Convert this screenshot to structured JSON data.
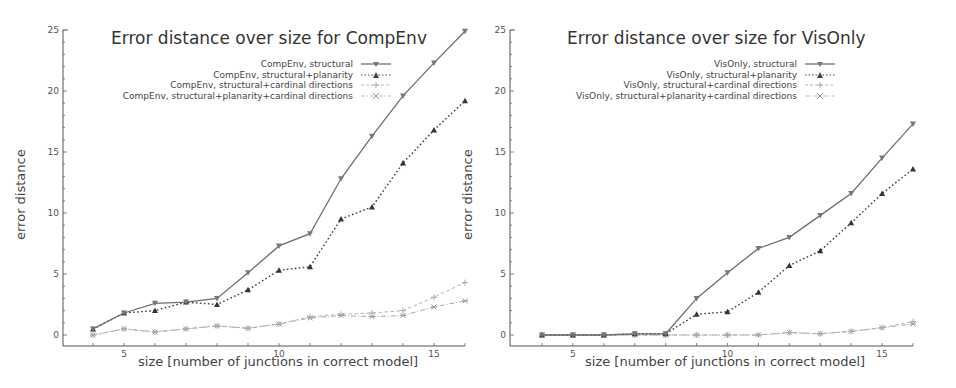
{
  "chart_data": [
    {
      "type": "line",
      "title": "Error distance over size for CompEnv",
      "xlabel": "size [number of junctions in correct model]",
      "ylabel": "error distance",
      "x": [
        4,
        5,
        6,
        7,
        8,
        9,
        10,
        11,
        12,
        13,
        14,
        15,
        16
      ],
      "xticks": [
        5,
        10,
        15
      ],
      "yticks": [
        0,
        5,
        10,
        15,
        20,
        25
      ],
      "xlim": [
        3,
        16
      ],
      "ylim": [
        -1,
        25
      ],
      "grid": false,
      "legend_position": "upper center-right",
      "series": [
        {
          "name": "CompEnv, structural",
          "style": "solid",
          "marker": "triangle-down",
          "values": [
            0.5,
            1.8,
            2.6,
            2.7,
            3.0,
            5.1,
            7.3,
            8.3,
            12.8,
            16.3,
            19.6,
            22.3,
            24.9
          ]
        },
        {
          "name": "CompEnv, structural+planarity",
          "style": "dotted",
          "marker": "triangle-up",
          "values": [
            0.5,
            1.8,
            2.0,
            2.7,
            2.5,
            3.7,
            5.3,
            5.6,
            9.5,
            10.5,
            14.1,
            16.8,
            19.2
          ]
        },
        {
          "name": "CompEnv, structural+cardinal directions",
          "style": "dashed",
          "marker": "plus",
          "values": [
            0.0,
            0.5,
            0.25,
            0.5,
            0.75,
            0.55,
            0.9,
            1.5,
            1.7,
            1.8,
            2.0,
            3.1,
            4.3
          ]
        },
        {
          "name": "CompEnv, structural+planarity+cardinal directions",
          "style": "dashdot",
          "marker": "star",
          "values": [
            0.0,
            0.5,
            0.25,
            0.5,
            0.75,
            0.55,
            0.9,
            1.4,
            1.6,
            1.5,
            1.6,
            2.3,
            2.8
          ]
        }
      ]
    },
    {
      "type": "line",
      "title": "Error distance over size for VisOnly",
      "xlabel": "size [number of junctions in correct model]",
      "ylabel": "error distance",
      "x": [
        4,
        5,
        6,
        7,
        8,
        9,
        10,
        11,
        12,
        13,
        14,
        15,
        16
      ],
      "xticks": [
        5,
        10,
        15
      ],
      "yticks": [
        0,
        5,
        10,
        15,
        20,
        25
      ],
      "xlim": [
        3,
        16
      ],
      "ylim": [
        -1,
        25
      ],
      "grid": false,
      "legend_position": "upper center-right",
      "series": [
        {
          "name": "VisOnly, structural",
          "style": "solid",
          "marker": "triangle-down",
          "values": [
            0,
            0,
            0,
            0.1,
            0.1,
            3.0,
            5.1,
            7.1,
            8.0,
            9.8,
            11.6,
            14.5,
            17.3
          ]
        },
        {
          "name": "VisOnly, structural+planarity",
          "style": "dotted",
          "marker": "triangle-up",
          "values": [
            0,
            0,
            0,
            0.1,
            0.1,
            1.7,
            1.9,
            3.5,
            5.7,
            6.9,
            9.2,
            11.6,
            13.6
          ]
        },
        {
          "name": "VisOnly, structural+cardinal directions",
          "style": "dashed",
          "marker": "plus",
          "values": [
            0,
            0,
            0,
            0,
            0,
            0,
            0,
            0,
            0.2,
            0.1,
            0.3,
            0.6,
            1.1
          ]
        },
        {
          "name": "VisOnly, structural+planarity+cardinal directions",
          "style": "dashdot",
          "marker": "star",
          "values": [
            0,
            0,
            0,
            0,
            0,
            0,
            0,
            0,
            0.2,
            0.1,
            0.3,
            0.6,
            0.9
          ]
        }
      ]
    }
  ]
}
